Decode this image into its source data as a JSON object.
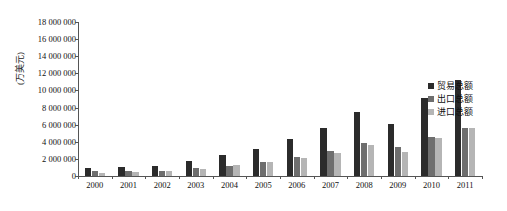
{
  "chart_data": {
    "type": "bar",
    "title": "",
    "xlabel": "",
    "ylabel": "(万美元)",
    "ylim": [
      0,
      18000000
    ],
    "ytick_step": 2000000,
    "grid": false,
    "legend_position": "right",
    "categories": [
      "2000",
      "2001",
      "2002",
      "2003",
      "2004",
      "2005",
      "2006",
      "2007",
      "2008",
      "2009",
      "2010",
      "2011"
    ],
    "ytick_labels": [
      "18 000 000",
      "16 000 000",
      "14 000 000",
      "12 000 000",
      "10 000 000",
      "8 000 000",
      "6 000 000",
      "4 000 000",
      "2 000 000",
      "0"
    ],
    "series": [
      {
        "name": "贸易总额",
        "color": "#2b2b2b",
        "values": [
          940000,
          1000000,
          1150000,
          1700000,
          2450000,
          3180000,
          4280000,
          5600000,
          7500000,
          6100000,
          9100000,
          11200000
        ]
      },
      {
        "name": "出口总额",
        "color": "#6e6e6e",
        "values": [
          620000,
          560000,
          620000,
          880000,
          1200000,
          1580000,
          2200000,
          2900000,
          3900000,
          3350000,
          4600000,
          5600000
        ]
      },
      {
        "name": "进口总额",
        "color": "#b5b5b5",
        "values": [
          320000,
          440000,
          530000,
          820000,
          1250000,
          1600000,
          2080000,
          2700000,
          3600000,
          2750000,
          4500000,
          5600000
        ]
      }
    ]
  },
  "legend": {
    "items": [
      {
        "label": "贸易总额"
      },
      {
        "label": "出口总额"
      },
      {
        "label": "进口总额"
      }
    ]
  }
}
